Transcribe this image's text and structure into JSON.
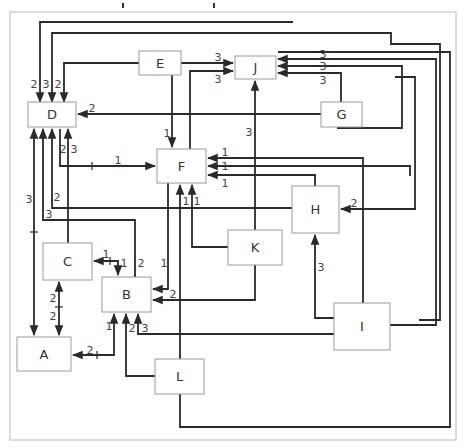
{
  "diagram": {
    "type": "directed-graph",
    "frame": {
      "x": 10,
      "y": 12,
      "w": 446,
      "h": 428,
      "color": "#b8b8b8"
    },
    "edge_color": "#2a2a2a",
    "nodes": [
      {
        "id": "D",
        "label": "D",
        "x": 28,
        "y": 102,
        "w": 48,
        "h": 25
      },
      {
        "id": "E",
        "label": "E",
        "x": 139,
        "y": 51,
        "w": 42,
        "h": 24
      },
      {
        "id": "J",
        "label": "J",
        "x": 235,
        "y": 56,
        "w": 41,
        "h": 23
      },
      {
        "id": "G",
        "label": "G",
        "x": 321,
        "y": 102,
        "w": 41,
        "h": 25
      },
      {
        "id": "F",
        "label": "F",
        "x": 157,
        "y": 149,
        "w": 49,
        "h": 34
      },
      {
        "id": "H",
        "label": "H",
        "x": 292,
        "y": 186,
        "w": 47,
        "h": 47
      },
      {
        "id": "C",
        "label": "C",
        "x": 43,
        "y": 243,
        "w": 49,
        "h": 37
      },
      {
        "id": "K",
        "label": "K",
        "x": 228,
        "y": 230,
        "w": 54,
        "h": 35
      },
      {
        "id": "B",
        "label": "B",
        "x": 102,
        "y": 277,
        "w": 49,
        "h": 35
      },
      {
        "id": "I",
        "label": "I",
        "x": 334,
        "y": 303,
        "w": 56,
        "h": 47
      },
      {
        "id": "A",
        "label": "A",
        "x": 17,
        "y": 337,
        "w": 54,
        "h": 34
      },
      {
        "id": "L",
        "label": "L",
        "x": 155,
        "y": 359,
        "w": 49,
        "h": 35
      }
    ],
    "edges": [
      {
        "from": "H",
        "to": "D",
        "weight": "2",
        "path": [
          [
            293,
            22
          ],
          [
            40,
            22
          ],
          [
            40,
            102
          ]
        ],
        "arrow": "end",
        "label_pos": [
          34,
          84
        ]
      },
      {
        "from": "I",
        "to": "D",
        "weight": "3",
        "path": [
          [
            419,
            320
          ],
          [
            440,
            320
          ],
          [
            440,
            44
          ],
          [
            391,
            44
          ],
          [
            391,
            33
          ],
          [
            52,
            33
          ],
          [
            52,
            102
          ]
        ],
        "arrow": "end",
        "label_pos": [
          46,
          84
        ]
      },
      {
        "from": "E",
        "to": "D",
        "weight": "2",
        "path": [
          [
            139,
            63
          ],
          [
            64,
            63
          ],
          [
            64,
            102
          ]
        ],
        "arrow": "end",
        "label_pos": [
          58,
          84
        ]
      },
      {
        "from": "E",
        "to": "J",
        "weight": "3",
        "path": [
          [
            181,
            63
          ],
          [
            233,
            63
          ]
        ],
        "arrow": "end",
        "label_pos": [
          218,
          57
        ]
      },
      {
        "from": "F",
        "to": "J",
        "weight": "3",
        "path": [
          [
            190,
            149
          ],
          [
            190,
            71
          ],
          [
            233,
            71
          ]
        ],
        "arrow": "end",
        "label_pos": [
          218,
          79
        ]
      },
      {
        "from": "E",
        "to": "F",
        "weight": "1",
        "path": [
          [
            172,
            75
          ],
          [
            172,
            147
          ]
        ],
        "arrow": "end",
        "label_pos": [
          167,
          133
        ]
      },
      {
        "from": "G",
        "to": "D",
        "weight": "2",
        "path": [
          [
            321,
            114
          ],
          [
            78,
            114
          ]
        ],
        "arrow": "end",
        "label_pos": [
          92,
          108
        ]
      },
      {
        "from": "D",
        "to": "F",
        "weight": "1",
        "path": [
          [
            60,
            129
          ],
          [
            60,
            166
          ],
          [
            155,
            166
          ]
        ],
        "arrow": "end",
        "label_pos": [
          118,
          160
        ],
        "tick": [
          92,
          166,
          "v"
        ]
      },
      {
        "from": "F",
        "to": "D",
        "weight": "2",
        "path": [
          [
            68,
            129
          ],
          [
            68,
            129
          ]
        ],
        "arrow": "none",
        "label_pos": [
          63,
          149
        ]
      },
      {
        "from": "C",
        "to": "D",
        "weight": "3",
        "path": [
          [
            68,
            243
          ],
          [
            68,
            129
          ]
        ],
        "arrow": "end",
        "label_pos": [
          74,
          149
        ]
      },
      {
        "from": "I",
        "to": "J",
        "weight": "3",
        "path": [
          [
            338,
            320
          ],
          [
            338,
            320
          ]
        ],
        "arrow": "none",
        "label_pos": [
          0,
          0
        ]
      },
      {
        "from": "I",
        "to": "J",
        "weight": "3",
        "path": [
          [
            390,
            325
          ],
          [
            436,
            325
          ],
          [
            436,
            59
          ],
          [
            278,
            59
          ]
        ],
        "arrow": "end",
        "label_pos": [
          323,
          54
        ]
      },
      {
        "from": "H",
        "to": "J",
        "weight": "3",
        "path": [
          [
            337,
            128
          ],
          [
            402,
            128
          ],
          [
            402,
            66
          ],
          [
            278,
            66
          ]
        ],
        "arrow": "end",
        "label_pos": [
          323,
          66
        ]
      },
      {
        "from": "G",
        "to": "J",
        "weight": "3",
        "path": [
          [
            341,
            102
          ],
          [
            341,
            73
          ],
          [
            278,
            73
          ]
        ],
        "arrow": "end",
        "label_pos": [
          323,
          80
        ]
      },
      {
        "from": "K",
        "to": "J",
        "weight": "3",
        "path": [
          [
            255,
            230
          ],
          [
            255,
            81
          ]
        ],
        "arrow": "end",
        "label_pos": [
          249,
          132
        ]
      },
      {
        "from": "I",
        "to": "F",
        "weight": "1",
        "path": [
          [
            363,
            303
          ],
          [
            363,
            158
          ],
          [
            208,
            158
          ]
        ],
        "arrow": "end",
        "label_pos": [
          225,
          152
        ]
      },
      {
        "from": "J2",
        "to": "F",
        "weight": "1",
        "path": [
          [
            410,
            176
          ],
          [
            410,
            166
          ],
          [
            208,
            166
          ]
        ],
        "arrow": "end",
        "label_pos": [
          225,
          166
        ]
      },
      {
        "from": "H",
        "to": "F",
        "weight": "1",
        "path": [
          [
            315,
            186
          ],
          [
            315,
            175
          ],
          [
            208,
            175
          ]
        ],
        "arrow": "end",
        "label_pos": [
          225,
          183
        ]
      },
      {
        "from": "F",
        "to": "B",
        "weight": "1",
        "path": [
          [
            168,
            183
          ],
          [
            168,
            289
          ],
          [
            153,
            289
          ]
        ],
        "arrow": "end",
        "label_pos": [
          164,
          263
        ]
      },
      {
        "from": "K",
        "to": "F",
        "weight": "1",
        "path": [
          [
            228,
            247
          ],
          [
            192,
            247
          ],
          [
            192,
            185
          ]
        ],
        "arrow": "end",
        "label_pos": [
          197,
          201
        ]
      },
      {
        "from": "L",
        "to": "F",
        "weight": "1",
        "path": [
          [
            180,
            359
          ],
          [
            180,
            185
          ]
        ],
        "arrow": "end",
        "label_pos": [
          186,
          201
        ]
      },
      {
        "from": "H",
        "to": "D",
        "weight": "2",
        "path": [
          [
            292,
            208
          ],
          [
            52,
            208
          ],
          [
            52,
            129
          ]
        ],
        "arrow": "end",
        "label_pos": [
          57,
          197
        ]
      },
      {
        "from": "J",
        "to": "H",
        "weight": "2",
        "path": [
          [
            395,
            77
          ],
          [
            415,
            77
          ],
          [
            415,
            209
          ],
          [
            341,
            209
          ]
        ],
        "arrow": "end",
        "label_pos": [
          354,
          203
        ]
      },
      {
        "from": "B",
        "to": "D",
        "weight": "3",
        "path": [
          [
            135,
            277
          ],
          [
            135,
            220
          ],
          [
            43,
            220
          ],
          [
            43,
            129
          ]
        ],
        "arrow": "end",
        "label_pos": [
          49,
          214
        ]
      },
      {
        "from": "D",
        "to": "A",
        "weight": "3",
        "path": [
          [
            34,
            129
          ],
          [
            34,
            335
          ]
        ],
        "arrow": "both",
        "label_pos": [
          29,
          199
        ],
        "tick": [
          34,
          232,
          "h"
        ]
      },
      {
        "from": "C",
        "to": "B",
        "weight": "1",
        "path": [
          [
            94,
            261
          ],
          [
            118,
            261
          ],
          [
            118,
            275
          ]
        ],
        "arrow": "start-end",
        "label_pos": [
          106,
          254
        ],
        "label2": "1",
        "label2_pos": [
          124,
          263
        ],
        "tick": [
          110,
          261,
          "v"
        ]
      },
      {
        "from": "C",
        "to": "A",
        "weight": "2",
        "path": [
          [
            59,
            282
          ],
          [
            59,
            335
          ]
        ],
        "arrow": "both",
        "label_pos": [
          53,
          298
        ],
        "label2": "2",
        "label2_pos": [
          53,
          316
        ],
        "tick": [
          59,
          307,
          "h"
        ]
      },
      {
        "from": "K",
        "to": "B",
        "weight": "2",
        "path": [
          [
            255,
            265
          ],
          [
            255,
            300
          ],
          [
            153,
            300
          ]
        ],
        "arrow": "end",
        "label_pos": [
          173,
          294
        ]
      },
      {
        "from": "B",
        "to": "A",
        "weight": "2",
        "path": [
          [
            114,
            314
          ],
          [
            114,
            355
          ],
          [
            73,
            355
          ]
        ],
        "arrow": "both",
        "label_pos": [
          90,
          350
        ],
        "label2": "1",
        "label2_pos": [
          109,
          326
        ],
        "tick": [
          97,
          355,
          "v"
        ]
      },
      {
        "from": "L",
        "to": "B",
        "weight": "2",
        "path": [
          [
            155,
            376
          ],
          [
            126,
            376
          ],
          [
            126,
            314
          ]
        ],
        "arrow": "end",
        "label_pos": [
          132,
          328
        ]
      },
      {
        "from": "I",
        "to": "B",
        "weight": "3",
        "path": [
          [
            334,
            334
          ],
          [
            138,
            334
          ],
          [
            138,
            314
          ]
        ],
        "arrow": "end",
        "label_pos": [
          145,
          328
        ]
      },
      {
        "from": "I",
        "to": "H",
        "weight": "3",
        "path": [
          [
            334,
            318
          ],
          [
            315,
            318
          ],
          [
            315,
            235
          ]
        ],
        "arrow": "end",
        "label_pos": [
          321,
          267
        ]
      },
      {
        "from": "L",
        "to": "J",
        "weight": "3",
        "path": [
          [
            180,
            394
          ],
          [
            180,
            427
          ],
          [
            450,
            427
          ],
          [
            450,
            52
          ],
          [
            278,
            52
          ]
        ],
        "arrow": "none",
        "label_pos": [
          0,
          0
        ]
      },
      {
        "from": "B-in",
        "to": "B",
        "weight": "2",
        "path": [
          [
            135,
            277
          ],
          [
            135,
            275
          ]
        ],
        "arrow": "none",
        "label_pos": [
          141,
          263
        ]
      }
    ],
    "top_marks": [
      [
        123,
        3
      ],
      [
        214,
        3
      ]
    ]
  }
}
